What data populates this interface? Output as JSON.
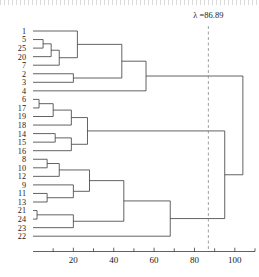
{
  "figure": {
    "type": "dendrogram",
    "title": "",
    "xlabel": "",
    "ylabel": ""
  },
  "annotation": {
    "cut_label": "λ =86.89",
    "cut_value": 86.89,
    "line_style": "dashed"
  },
  "axis": {
    "min": 0,
    "max": 110,
    "tick_labels": [
      "20",
      "40",
      "60",
      "80",
      "100"
    ],
    "tick_values": [
      20,
      40,
      60,
      80,
      100
    ],
    "minor_tick_values": [
      10,
      30,
      50,
      70,
      90,
      110
    ],
    "orientation": "bottom"
  },
  "chart_data": {
    "type": "dendrogram",
    "title": "",
    "xlabel": "",
    "ylabel": "",
    "xlim": [
      0,
      110
    ],
    "grid": false,
    "legend": "none",
    "leaf_order": [
      "1",
      "5",
      "25",
      "20",
      "7",
      "2",
      "3",
      "4",
      "6",
      "17",
      "19",
      "18",
      "14",
      "15",
      "16",
      "8",
      "10",
      "12",
      "9",
      "11",
      "13",
      "21",
      "24",
      "23",
      "22"
    ],
    "leaf_count": 25,
    "tick_labels": [
      "20",
      "40",
      "60",
      "80",
      "100"
    ],
    "cut_value": 86.89,
    "cut_label": "λ =86.89",
    "merges": [
      {
        "id": "m1",
        "left": "5",
        "right": "25",
        "height": 5
      },
      {
        "id": "m2",
        "left": "m1",
        "right": "20",
        "height": 9
      },
      {
        "id": "m3",
        "left": "m2",
        "right": "7",
        "height": 13
      },
      {
        "id": "m4",
        "left": "1",
        "right": "m3",
        "height": 22
      },
      {
        "id": "m5",
        "left": "2",
        "right": "3",
        "height": 20
      },
      {
        "id": "m6",
        "left": "m4",
        "right": "m5",
        "height": 44
      },
      {
        "id": "m7",
        "left": "m6",
        "right": "4",
        "height": 56
      },
      {
        "id": "m8",
        "left": "6",
        "right": "17",
        "height": 3
      },
      {
        "id": "m9",
        "left": "m8",
        "right": "19",
        "height": 10
      },
      {
        "id": "m10",
        "left": "m9",
        "right": "18",
        "height": 19
      },
      {
        "id": "m11",
        "left": "14",
        "right": "15",
        "height": 11
      },
      {
        "id": "m12",
        "left": "m11",
        "right": "16",
        "height": 19
      },
      {
        "id": "m13",
        "left": "m10",
        "right": "m12",
        "height": 27
      },
      {
        "id": "m14",
        "left": "8",
        "right": "10",
        "height": 7
      },
      {
        "id": "m15",
        "left": "m14",
        "right": "12",
        "height": 13
      },
      {
        "id": "m16",
        "left": "11",
        "right": "13",
        "height": 7
      },
      {
        "id": "m17",
        "left": "9",
        "right": "m16",
        "height": 20
      },
      {
        "id": "m18",
        "left": "m15",
        "right": "m17",
        "height": 28
      },
      {
        "id": "m19",
        "left": "21",
        "right": "24",
        "height": 2
      },
      {
        "id": "m20",
        "left": "m19",
        "right": "23",
        "height": 20
      },
      {
        "id": "m21",
        "left": "m18",
        "right": "m20",
        "height": 45
      },
      {
        "id": "m22",
        "left": "m21",
        "right": "22",
        "height": 68
      },
      {
        "id": "m23",
        "left": "m13",
        "right": "m22",
        "height": 95
      },
      {
        "id": "m24",
        "left": "m7",
        "right": "m23",
        "height": 104
      }
    ]
  },
  "colors": {
    "line": "#3b3b3b",
    "cut_line": "#8a8a8a",
    "background": "#ffffff",
    "text": "#1a1a1a"
  }
}
